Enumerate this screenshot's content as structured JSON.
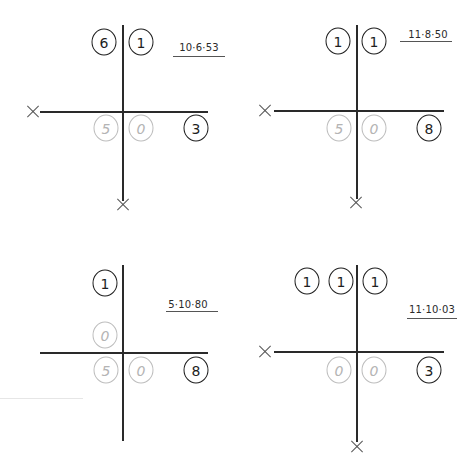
{
  "colors": {
    "ink": "#1e1e1e",
    "faded": "#b4b4b4",
    "background": "#ffffff"
  },
  "panels": [
    {
      "id": "top-left",
      "date_label": "10·6·53",
      "upper_beads": [
        {
          "value": "6",
          "style": "dark"
        },
        {
          "value": "1",
          "style": "dark"
        }
      ],
      "lower_beads": [
        {
          "value": "5",
          "style": "faded"
        },
        {
          "value": "0",
          "style": "faded"
        },
        {
          "value": "3",
          "style": "dark"
        }
      ],
      "x_marks": [
        "left",
        "bottom"
      ]
    },
    {
      "id": "top-right",
      "date_label": "11·8·50",
      "upper_beads": [
        {
          "value": "1",
          "style": "dark"
        },
        {
          "value": "1",
          "style": "dark"
        }
      ],
      "lower_beads": [
        {
          "value": "5",
          "style": "faded"
        },
        {
          "value": "0",
          "style": "faded"
        },
        {
          "value": "8",
          "style": "dark"
        }
      ],
      "x_marks": [
        "left",
        "bottom"
      ]
    },
    {
      "id": "bottom-left",
      "date_label": "5·10·80",
      "upper_beads": [
        {
          "value": "1",
          "style": "dark"
        },
        {
          "value": "0",
          "style": "faded"
        }
      ],
      "lower_beads": [
        {
          "value": "5",
          "style": "faded"
        },
        {
          "value": "0",
          "style": "faded"
        },
        {
          "value": "8",
          "style": "dark"
        }
      ],
      "x_marks": []
    },
    {
      "id": "bottom-right",
      "date_label": "11·10·03",
      "upper_beads": [
        {
          "value": "1",
          "style": "dark"
        },
        {
          "value": "1",
          "style": "dark"
        },
        {
          "value": "1",
          "style": "dark"
        }
      ],
      "lower_beads": [
        {
          "value": "0",
          "style": "faded"
        },
        {
          "value": "0",
          "style": "faded"
        },
        {
          "value": "3",
          "style": "dark"
        }
      ],
      "x_marks": [
        "left",
        "bottom"
      ]
    }
  ]
}
